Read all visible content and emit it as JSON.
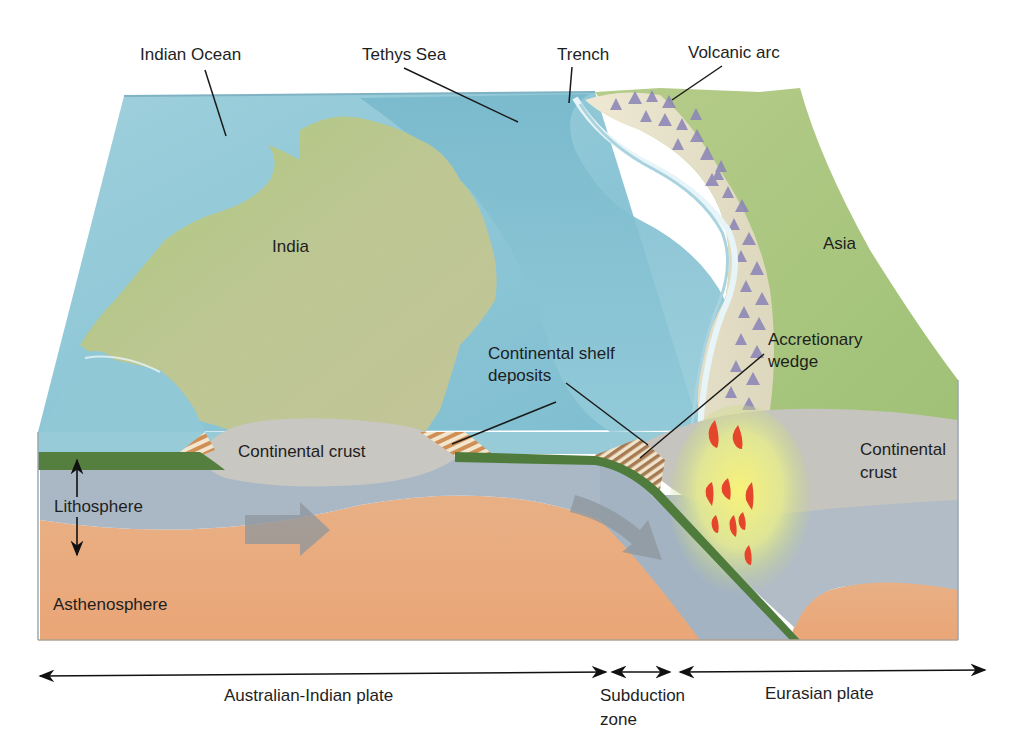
{
  "diagram": {
    "type": "block-diagram",
    "colors": {
      "ocean": "#8cc6d6",
      "ocean_deep": "#6fb3c8",
      "land_india": "#b9c98a",
      "land_asia": "#a9c47c",
      "continental_crust": "#c8c6c0",
      "lithosphere": "#aab7c4",
      "asthenosphere": "#e9a878",
      "oceanic_crust_band": "#4f7c3c",
      "magma": "#e5452b",
      "melt_glow": "#f4ef7a",
      "mountains": "#8a84b8",
      "sediment": "#d9a36b"
    }
  },
  "labels": {
    "indian_ocean": "Indian Ocean",
    "tethys_sea": "Tethys Sea",
    "trench": "Trench",
    "volcanic_arc": "Volcanic arc",
    "india": "India",
    "asia": "Asia",
    "continental_shelf_deposits_line1": "Continental shelf",
    "continental_shelf_deposits_line2": "deposits",
    "accretionary_wedge_line1": "Accretionary",
    "accretionary_wedge_line2": "wedge",
    "continental_crust_left": "Continental crust",
    "continental_crust_right_line1": "Continental",
    "continental_crust_right_line2": "crust",
    "lithosphere": "Lithosphere",
    "asthenosphere": "Asthenosphere"
  },
  "plates": {
    "australian_indian": "Australian-Indian plate",
    "subduction_line1": "Subduction",
    "subduction_line2": "zone",
    "eurasian": "Eurasian plate"
  }
}
